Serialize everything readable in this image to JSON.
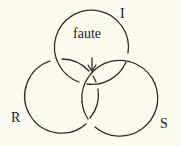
{
  "diagram": {
    "type": "borromean-knot",
    "background": "#fbfbf0",
    "stroke": "#2e2e2e",
    "rings": [
      {
        "id": "I",
        "label": "I",
        "cx": 91,
        "cy": 47,
        "r": 37
      },
      {
        "id": "R",
        "label": "R",
        "cx": 62,
        "cy": 96,
        "r": 37
      },
      {
        "id": "S",
        "label": "S",
        "cx": 119,
        "cy": 97,
        "r": 38
      }
    ],
    "annotation": {
      "text": "faute",
      "arrow": "down"
    }
  }
}
